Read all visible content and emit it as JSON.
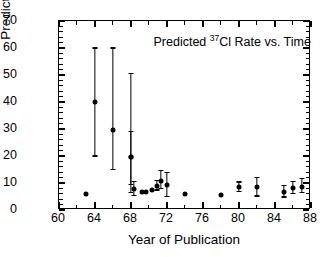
{
  "chart_data": {
    "type": "scatter",
    "title": "Predicted 37Cl Rate vs. Time",
    "title_prefix": "Predicted ",
    "title_superscript": "37",
    "title_suffix": "Cl Rate vs. Time",
    "xlabel": "Year of Publication",
    "ylabel": "Predicted SNU",
    "xlim": [
      60,
      88
    ],
    "ylim": [
      0,
      70
    ],
    "xticks": [
      60,
      64,
      68,
      72,
      76,
      80,
      84,
      88
    ],
    "xtick_labels": [
      "60",
      "64",
      "68",
      "72",
      "76",
      "80",
      "84",
      "88"
    ],
    "xminor_step": 2,
    "yticks": [
      0,
      10,
      20,
      30,
      40,
      50,
      60,
      70
    ],
    "ytick_labels": [
      "0",
      "10",
      "20",
      "30",
      "40",
      "50",
      "60",
      "70"
    ],
    "yminor_step": 2,
    "grid": false,
    "legend": "none",
    "marker_color": "#000000",
    "axis_color": "#000000",
    "background_color": "#ffffff",
    "points": [
      {
        "x": 63.0,
        "y": 6.0,
        "yerr_low": null,
        "yerr_high": null
      },
      {
        "x": 64.0,
        "y": 40.0,
        "yerr_low": 20.0,
        "yerr_high": 60.0
      },
      {
        "x": 66.0,
        "y": 29.5,
        "yerr_low": 15.0,
        "yerr_high": 60.0
      },
      {
        "x": 68.0,
        "y": 19.5,
        "yerr_low": 6.5,
        "yerr_high": 50.5
      },
      {
        "x": 68.0,
        "y": 19.5,
        "yerr_low": 9.5,
        "yerr_high": 29.0
      },
      {
        "x": 68.3,
        "y": 7.8,
        "yerr_low": 5.5,
        "yerr_high": 10.5
      },
      {
        "x": 69.2,
        "y": 6.6,
        "yerr_low": null,
        "yerr_high": null
      },
      {
        "x": 69.7,
        "y": 6.8,
        "yerr_low": null,
        "yerr_high": null
      },
      {
        "x": 70.3,
        "y": 7.4,
        "yerr_low": null,
        "yerr_high": null
      },
      {
        "x": 70.9,
        "y": 8.9,
        "yerr_low": 7.4,
        "yerr_high": 11.0
      },
      {
        "x": 71.3,
        "y": 10.9,
        "yerr_low": 8.0,
        "yerr_high": 14.5
      },
      {
        "x": 72.0,
        "y": 9.3,
        "yerr_low": 5.0,
        "yerr_high": 14.0
      },
      {
        "x": 74.0,
        "y": 6.0,
        "yerr_low": null,
        "yerr_high": null
      },
      {
        "x": 78.0,
        "y": 5.5,
        "yerr_low": null,
        "yerr_high": null
      },
      {
        "x": 80.0,
        "y": 8.4,
        "yerr_low": 6.9,
        "yerr_high": 10.4
      },
      {
        "x": 82.0,
        "y": 8.5,
        "yerr_low": 5.2,
        "yerr_high": 12.0
      },
      {
        "x": 85.0,
        "y": 6.8,
        "yerr_low": 4.8,
        "yerr_high": 9.0
      },
      {
        "x": 86.0,
        "y": 8.2,
        "yerr_low": 6.2,
        "yerr_high": 10.6
      },
      {
        "x": 87.0,
        "y": 8.6,
        "yerr_low": 6.4,
        "yerr_high": 11.6
      }
    ]
  }
}
